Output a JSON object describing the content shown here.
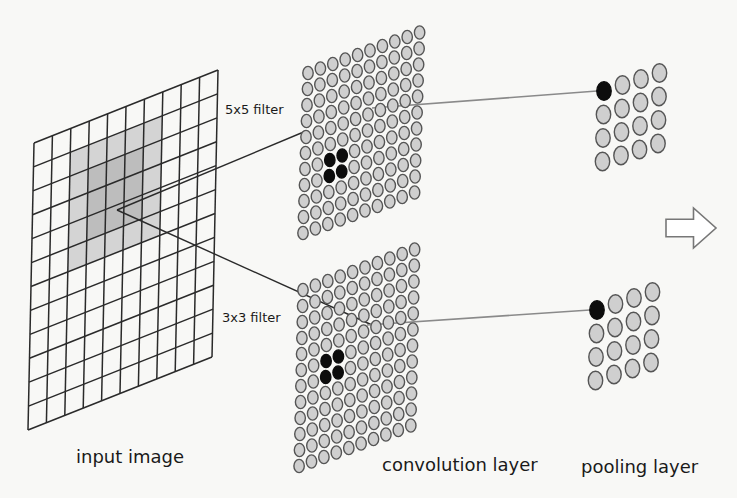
{
  "colors": {
    "background": "#f8f8f6",
    "grid_line": "#2a2a2a",
    "shade_light": "#d4d4d4",
    "shade_dark": "#bdbdbd",
    "neuron_fill": "#cfcfcf",
    "neuron_stroke": "#555555",
    "neuron_active": "#0d0d0d",
    "connector_dark": "#2a2a2a",
    "connector_gray": "#8a8a8a",
    "arrow_stroke": "#777777"
  },
  "labels": {
    "filter_5x5": "5x5 filter",
    "filter_3x3": "3x3 filter",
    "input_image": "input image",
    "convolution_layer": "convolution layer",
    "pooling_layer": "pooling layer"
  },
  "input_grid": {
    "columns": 10,
    "rows": 12,
    "corners": {
      "tl": [
        34,
        143
      ],
      "tr": [
        218,
        70
      ],
      "br": [
        212,
        357
      ],
      "bl": [
        28,
        430
      ]
    },
    "shaded_outer": {
      "col_start": 2,
      "col_end": 7,
      "row_start": 1,
      "row_end": 6
    },
    "shaded_inner": {
      "col_start": 3,
      "col_end": 6,
      "row_start": 2,
      "row_end": 5
    },
    "center_point": [
      117,
      210
    ]
  },
  "conv_blocks": [
    {
      "id": "conv-5x5",
      "columns": 10,
      "rows": 11,
      "origin": [
        308,
        73
      ],
      "col_step": [
        12.4,
        -4.5
      ],
      "row_step": [
        -0.5,
        16.0
      ],
      "radius_x": 5.2,
      "radius_y": 6.6,
      "active": [
        [
          2,
          6
        ],
        [
          3,
          6
        ],
        [
          2,
          7
        ],
        [
          3,
          7
        ]
      ]
    },
    {
      "id": "conv-3x3",
      "columns": 10,
      "rows": 12,
      "origin": [
        303,
        290
      ],
      "col_step": [
        12.4,
        -4.5
      ],
      "row_step": [
        -0.35,
        16.0
      ],
      "radius_x": 5.2,
      "radius_y": 6.6,
      "active": [
        [
          2,
          5
        ],
        [
          3,
          5
        ],
        [
          2,
          6
        ],
        [
          3,
          6
        ]
      ]
    }
  ],
  "pool_blocks": [
    {
      "id": "pool-top",
      "columns": 4,
      "rows": 4,
      "origin": [
        604,
        91
      ],
      "col_step": [
        18.5,
        -6.0
      ],
      "row_step": [
        -0.5,
        23.5
      ],
      "radius_x": 7.2,
      "radius_y": 9.2,
      "active": [
        [
          0,
          0
        ]
      ]
    },
    {
      "id": "pool-bottom",
      "columns": 4,
      "rows": 4,
      "origin": [
        597,
        310
      ],
      "col_step": [
        18.5,
        -6.0
      ],
      "row_step": [
        -0.5,
        23.5
      ],
      "radius_x": 7.2,
      "radius_y": 9.2,
      "active": [
        [
          0,
          0
        ]
      ]
    }
  ],
  "connectors": [
    {
      "from": [
        117,
        210
      ],
      "to": [
        306,
        131
      ],
      "color": "dark"
    },
    {
      "from": [
        117,
        210
      ],
      "to": [
        372,
        325
      ],
      "color": "dark"
    },
    {
      "from": [
        372,
        108
      ],
      "to": [
        597,
        91
      ],
      "color": "gray"
    },
    {
      "from": [
        367,
        325
      ],
      "to": [
        590,
        310
      ],
      "color": "gray"
    }
  ],
  "next_arrow": {
    "x": 666,
    "y": 208,
    "width": 50,
    "height": 40
  },
  "label_positions": {
    "filter_5x5": [
      225,
      102
    ],
    "filter_3x3": [
      222,
      310
    ],
    "input_image": [
      76,
      446
    ],
    "convolution_layer": [
      382,
      454
    ],
    "pooling_layer": [
      581,
      456
    ]
  }
}
